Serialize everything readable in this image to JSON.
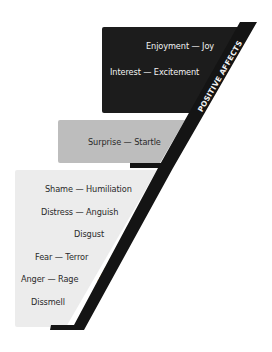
{
  "diagram": {
    "type": "affect-hierarchy",
    "colors": {
      "positive_fill": "#1c1c1c",
      "neutral_fill": "#bdbdbd",
      "negative_fill": "#ececec",
      "strip": "#141414",
      "positive_text": "#f2f2f2",
      "dark_text": "#2a2a2a"
    },
    "sections": [
      {
        "id": "positive",
        "label": "POSITIVE AFFECTS",
        "items": [
          "Enjoyment — Joy",
          "Interest — Excitement"
        ]
      },
      {
        "id": "neutral",
        "label": "NEUTRAL",
        "items": [
          "Surprise — Startle"
        ]
      },
      {
        "id": "negative",
        "label": "NEGATIVE AFFECTS",
        "items": [
          "Shame — Humiliation",
          "Distress — Anguish",
          "Disgust",
          "Fear — Terror",
          "Anger — Rage",
          "Dissmell"
        ]
      }
    ]
  }
}
